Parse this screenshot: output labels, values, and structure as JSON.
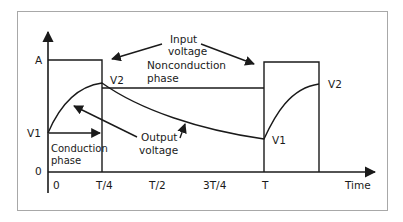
{
  "figure": {
    "axes": {
      "x_label": "Time",
      "x_ticks": [
        "0",
        "T/4",
        "T/2",
        "3T/4",
        "T"
      ],
      "y_ticks": [
        "A",
        "V1",
        "0"
      ]
    },
    "annotations": {
      "input_voltage": [
        "Input",
        "voltage"
      ],
      "nonconduction_phase": [
        "Nonconduction",
        "phase"
      ],
      "conduction_phase": [
        "Conduction",
        "phase"
      ],
      "output_voltage": [
        "Output",
        "voltage"
      ],
      "v2_first": "V2",
      "v2_second": "V2",
      "v1_second": "V1"
    },
    "colors": {
      "line": "#1a1a1a",
      "frame": "#a8a8a8",
      "background": "#ffffff"
    }
  }
}
